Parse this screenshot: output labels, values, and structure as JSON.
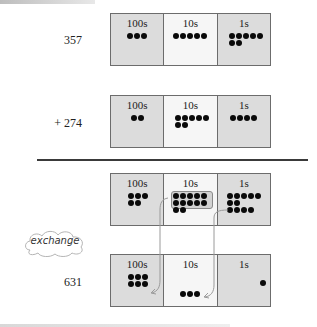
{
  "diagram": {
    "type": "place-value addition with regrouping",
    "columns": [
      "100s",
      "10s",
      "1s"
    ],
    "rows": [
      {
        "label": "357",
        "counts": {
          "hundreds": 3,
          "tens": 5,
          "ones": 7
        }
      },
      {
        "label": "+ 274",
        "counts": {
          "hundreds": 2,
          "tens": 7,
          "ones": 4
        }
      },
      {
        "label": "",
        "counts": {
          "hundreds": 5,
          "tens": 12,
          "ones": 11
        },
        "grouped": {
          "tens": 10,
          "ones": 10
        }
      },
      {
        "label": "631",
        "counts": {
          "hundreds": 6,
          "tens": 3,
          "ones": 1
        }
      }
    ],
    "annotation": "exchange",
    "colors": {
      "shaded_cell": "#dcdcdc",
      "light_cell": "#f6f6f6",
      "border": "#6c6c6c",
      "dot": "#0a0a0a",
      "arrow": "#9a9a9a"
    }
  },
  "labels": {
    "row1": "357",
    "row2": "+ 274",
    "row4": "631",
    "col_hundreds": "100s",
    "col_tens": "10s",
    "col_ones": "1s",
    "exchange": "exchange"
  }
}
